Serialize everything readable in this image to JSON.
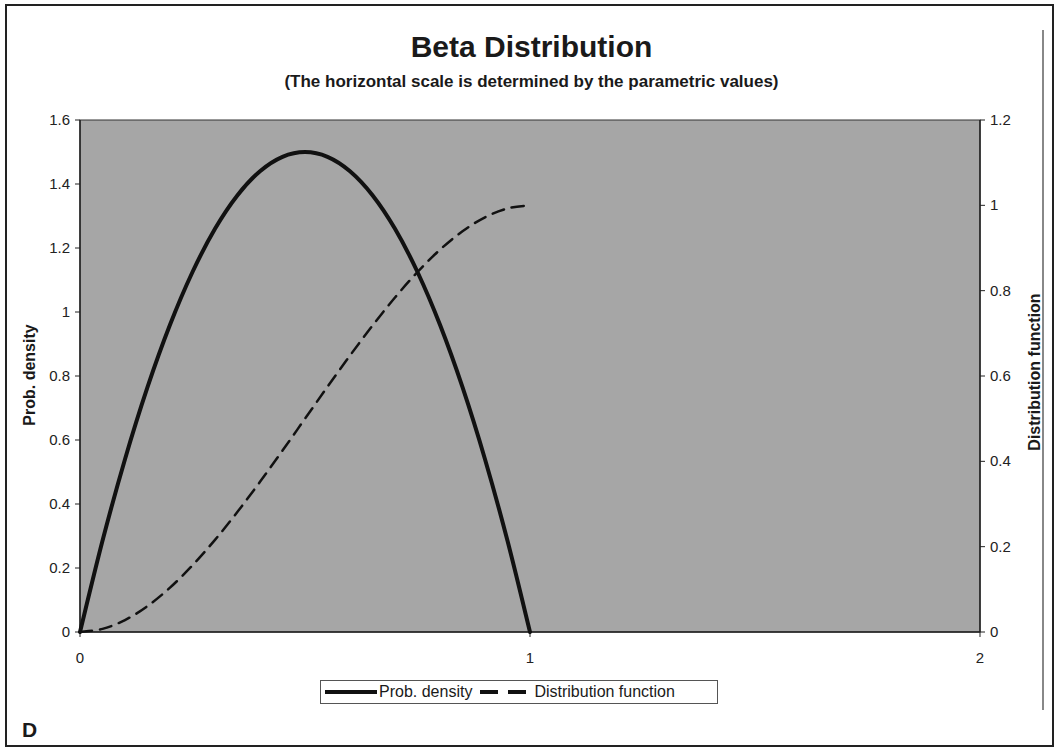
{
  "figure": {
    "title": "Beta Distribution",
    "subtitle": "(The horizontal scale is determined by the parametric values)",
    "panel_label": "D",
    "colors": {
      "plot_background": "#a6a6a6",
      "line": "#111111",
      "frame": "#222222"
    }
  },
  "axes": {
    "y_left_label": "Prob. density",
    "y_right_label": "Distribution function",
    "x_ticks": [
      "0",
      "1",
      "2"
    ],
    "y_left_ticks": [
      "0",
      "0.2",
      "0.4",
      "0.6",
      "0.8",
      "1",
      "1.2",
      "1.4",
      "1.6"
    ],
    "y_right_ticks": [
      "0",
      "0.2",
      "0.4",
      "0.6",
      "0.8",
      "1",
      "1.2"
    ]
  },
  "legend": {
    "items": [
      {
        "label": "Prob. density",
        "style": "solid"
      },
      {
        "label": "Distribution function",
        "style": "dashed"
      }
    ]
  },
  "chart_data": {
    "type": "line",
    "title": "Beta Distribution",
    "subtitle": "(The horizontal scale is determined by the parametric values)",
    "xlabel": "",
    "ylabel": "Prob. density",
    "ylabel_secondary": "Distribution function",
    "xlim": [
      0,
      2
    ],
    "ylim": [
      0,
      1.6
    ],
    "ylim_secondary": [
      0,
      1.2
    ],
    "x_ticks": [
      0,
      1,
      2
    ],
    "y_ticks": [
      0,
      0.2,
      0.4,
      0.6,
      0.8,
      1,
      1.2,
      1.4,
      1.6
    ],
    "y_ticks_secondary": [
      0,
      0.2,
      0.4,
      0.6,
      0.8,
      1,
      1.2
    ],
    "grid": false,
    "legend_position": "bottom",
    "x": [
      0,
      0.05,
      0.1,
      0.15,
      0.2,
      0.25,
      0.3,
      0.35,
      0.4,
      0.45,
      0.5,
      0.55,
      0.6,
      0.65,
      0.7,
      0.75,
      0.8,
      0.85,
      0.9,
      0.95,
      1.0
    ],
    "series": [
      {
        "name": "Prob. density",
        "axis": "left",
        "style": "solid",
        "values": [
          0,
          0.285,
          0.54,
          0.765,
          0.96,
          1.125,
          1.26,
          1.365,
          1.44,
          1.485,
          1.5,
          1.485,
          1.44,
          1.365,
          1.26,
          1.125,
          0.96,
          0.765,
          0.54,
          0.285,
          0
        ]
      },
      {
        "name": "Distribution function",
        "axis": "right",
        "style": "dashed",
        "values": [
          0,
          0.00725,
          0.028,
          0.06075,
          0.104,
          0.15625,
          0.216,
          0.28175,
          0.352,
          0.42525,
          0.5,
          0.57475,
          0.648,
          0.71825,
          0.784,
          0.84375,
          0.896,
          0.93925,
          0.972,
          0.99275,
          1.0
        ]
      }
    ]
  }
}
